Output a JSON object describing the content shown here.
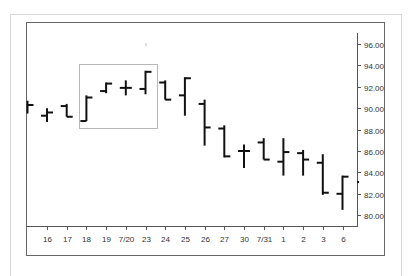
{
  "chart_data": {
    "type": "ohlc",
    "title": "",
    "xlabel": "",
    "ylabel": "",
    "ylim": [
      78.5,
      97.5
    ],
    "grid": false,
    "y_axis_position": "right",
    "y_ticks": [
      "96.00",
      "94.00",
      "92.00",
      "90.00",
      "88.00",
      "86.00",
      "84.00",
      "82.00",
      "80.00"
    ],
    "y_tick_values": [
      96,
      94,
      92,
      90,
      88,
      86,
      84,
      82,
      80
    ],
    "categories": [
      "",
      "16",
      "17",
      "18",
      "19",
      "7/20",
      "23",
      "24",
      "25",
      "26",
      "27",
      "30",
      "7/31",
      "1",
      "2",
      "3",
      "6",
      ""
    ],
    "open": [
      90.4,
      89.3,
      90.2,
      88.8,
      91.6,
      91.9,
      91.8,
      92.4,
      91.2,
      90.4,
      88.1,
      86.0,
      86.8,
      85.0,
      85.8,
      84.9,
      82.0,
      83.1
    ],
    "high": [
      90.7,
      90.0,
      90.4,
      91.2,
      92.4,
      92.6,
      93.5,
      92.6,
      92.9,
      90.8,
      88.4,
      86.6,
      87.2,
      87.2,
      86.1,
      85.7,
      83.7,
      83.2
    ],
    "low": [
      89.5,
      88.7,
      89.2,
      88.8,
      91.4,
      91.2,
      91.3,
      90.8,
      89.3,
      86.5,
      85.4,
      84.4,
      85.2,
      83.7,
      83.7,
      81.9,
      80.5,
      83.0
    ],
    "close": [
      90.3,
      89.6,
      89.2,
      91.0,
      92.3,
      91.9,
      93.4,
      90.8,
      92.8,
      88.2,
      85.5,
      86.0,
      85.2,
      85.9,
      85.2,
      82.1,
      83.6,
      83.1
    ],
    "annotations": [
      {
        "type": "highlight-box",
        "from": "18",
        "to": "23",
        "description": "gray rectangle around rally bars 18 through 23"
      }
    ]
  },
  "colors": {
    "bars": "#111111",
    "axis": "#555555",
    "frame": "#d8d8d8",
    "highlight": "#b8b8b8"
  }
}
